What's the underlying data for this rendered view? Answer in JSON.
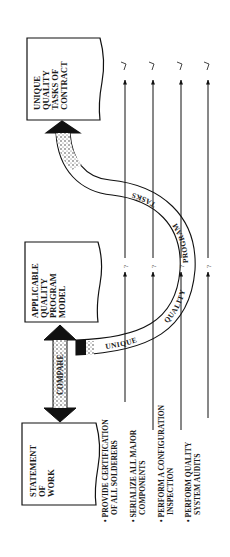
{
  "diagram": {
    "orientation": "rotated-90-ccw",
    "boxes": {
      "statement_of_work": [
        "STATEMENT",
        "OF",
        "WORK"
      ],
      "applicable_model": [
        "APPLICABLE",
        "QUALITY",
        "PROGRAM",
        "MODEL"
      ],
      "unique_tasks": [
        "UNIQUE",
        "QUALITY",
        "TASKS OF",
        "CONTRACT"
      ]
    },
    "compare_label": "COMPARE",
    "curve_words": [
      "UNIQUE",
      "QUALITY",
      "PROGRAM",
      "TASKS"
    ],
    "requirements": [
      {
        "lines": [
          "PROVIDE CERTIFICATION",
          "OF ALL SOLDERERS"
        ],
        "model_mark": "?",
        "unique_mark": "√"
      },
      {
        "lines": [
          "SERIALIZE ALL MAJOR",
          "COMPONENTS"
        ],
        "model_mark": "?",
        "unique_mark": "√"
      },
      {
        "lines": [
          "PERFORM A CONFIGURATION",
          "INSPECTION"
        ],
        "model_mark": "?",
        "unique_mark": "√"
      },
      {
        "lines": [
          "PERFORM QUALITY",
          "SYSTEM AUDITS"
        ],
        "model_mark": "?",
        "unique_mark": "√"
      }
    ],
    "bullet": "•",
    "colors": {
      "ink": "#1a1a1a",
      "paper": "#ffffff"
    }
  }
}
